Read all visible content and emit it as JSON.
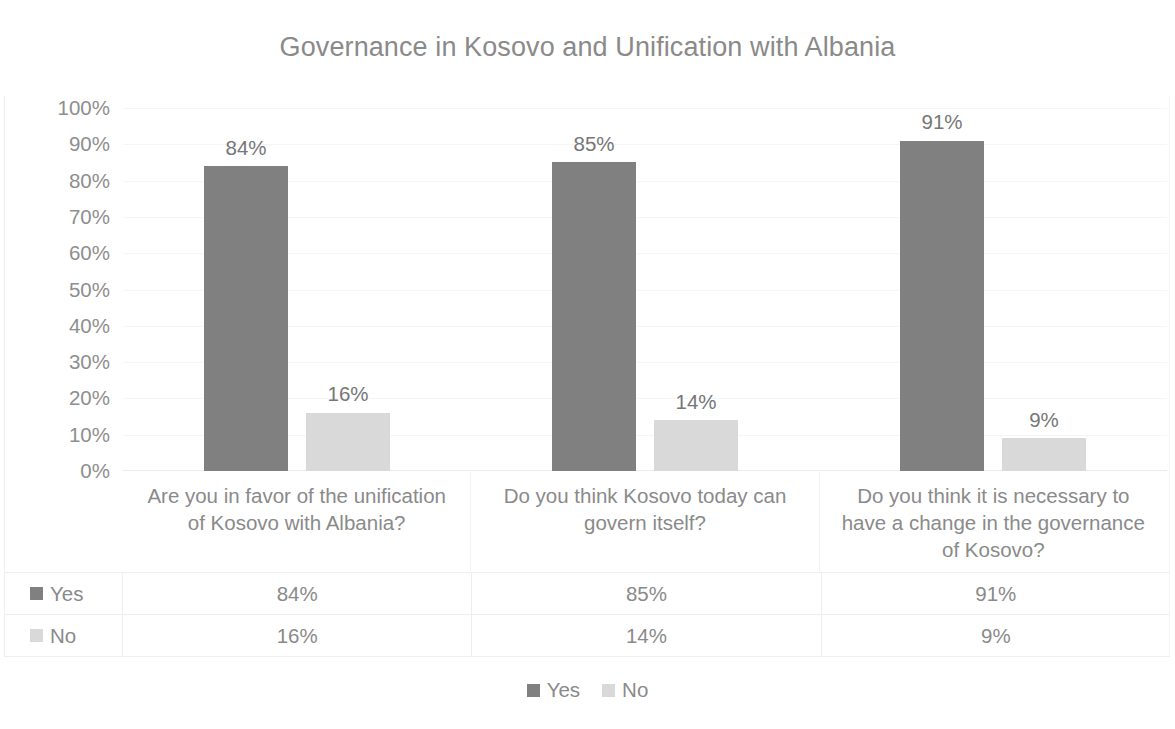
{
  "chart_data": {
    "type": "bar",
    "title": "Governance in Kosovo and Unification with Albania",
    "xlabel": "",
    "ylabel": "",
    "ylim": [
      0,
      100
    ],
    "grid": true,
    "legend_position": "bottom",
    "value_suffix": "%",
    "categories": [
      "Are you in favor of the unification of Kosovo with Albania?",
      "Do you think Kosovo today can govern itself?",
      "Do you think it is necessary to have a change in the governance of Kosovo?"
    ],
    "series": [
      {
        "name": "Yes",
        "color": "#808080",
        "values": [
          84,
          85,
          91
        ],
        "labels": [
          "84%",
          "85%",
          "91%"
        ]
      },
      {
        "name": "No",
        "color": "#d9d9d9",
        "values": [
          16,
          14,
          9
        ],
        "labels": [
          "16%",
          "14%",
          "9%"
        ]
      }
    ],
    "yticks": [
      {
        "value": 100,
        "label": "100%"
      },
      {
        "value": 90,
        "label": "90%"
      },
      {
        "value": 80,
        "label": "80%"
      },
      {
        "value": 70,
        "label": "70%"
      },
      {
        "value": 60,
        "label": "60%"
      },
      {
        "value": 50,
        "label": "50%"
      },
      {
        "value": 40,
        "label": "40%"
      },
      {
        "value": 30,
        "label": "30%"
      },
      {
        "value": 20,
        "label": "20%"
      },
      {
        "value": 10,
        "label": "10%"
      },
      {
        "value": 0,
        "label": "0%"
      }
    ]
  },
  "data_table": {
    "rows": [
      {
        "name": "Yes",
        "swatch": "yes",
        "cells": [
          "84%",
          "85%",
          "91%"
        ]
      },
      {
        "name": "No",
        "swatch": "no",
        "cells": [
          "16%",
          "14%",
          "9%"
        ]
      }
    ]
  },
  "legend": {
    "items": [
      {
        "label": "Yes",
        "swatch": "yes"
      },
      {
        "label": "No",
        "swatch": "no"
      }
    ]
  }
}
